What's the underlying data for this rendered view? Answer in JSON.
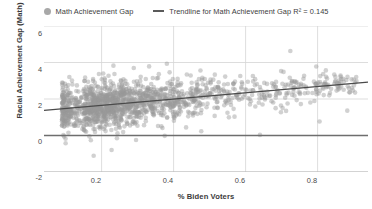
{
  "chart_data": {
    "type": "scatter",
    "title": "",
    "xlabel": "% Biden Voters",
    "ylabel": "Racial Achievement Gap (Math)",
    "xlim": [
      0.04,
      0.94
    ],
    "ylim": [
      -2,
      6
    ],
    "grid": true,
    "legend_position": "top",
    "xticks": [
      0.2,
      0.4,
      0.6,
      0.8
    ],
    "xtick_labels": [
      "0.2",
      "0.4",
      "0.6",
      "0.8"
    ],
    "yticks": [
      -2,
      0,
      2,
      4,
      6
    ],
    "ytick_labels": [
      "-2",
      "0",
      "2",
      "4",
      "6"
    ],
    "series": [
      {
        "name": "Math Achievement Gap",
        "type": "scatter",
        "marker_color": "#9a9a9a",
        "marker_size": 4.6,
        "marker_opacity": 0.45
      },
      {
        "name": "Trendline for Math Achievement Gap",
        "type": "line",
        "line_color": "#4a4a4a",
        "r_squared": 0.145,
        "endpoints": [
          [
            0.04,
            1.38
          ],
          [
            0.94,
            2.92
          ]
        ]
      }
    ],
    "zero_line": {
      "value": 0,
      "color": "#6e6e6e"
    }
  },
  "legend": {
    "entries": [
      {
        "label": "Math Achievement Gap",
        "marker": "circle-marker",
        "color": "#a8a8a8"
      },
      {
        "label": "Trendline for Math Achievement Gap R² = 0.145",
        "marker": "line-marker",
        "color": "#5a5a5a"
      }
    ]
  },
  "axes": {
    "y_title": "Racial Achievement Gap (Math)",
    "x_title": "% Biden Voters",
    "y_tick_labels": [
      "6",
      "4",
      "2",
      "0",
      "-2"
    ],
    "x_tick_labels": [
      "0.2",
      "0.4",
      "0.6",
      "0.8"
    ]
  }
}
